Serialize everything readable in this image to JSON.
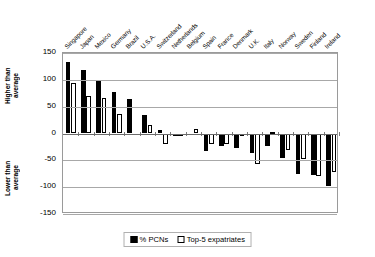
{
  "chart_data": {
    "type": "bar",
    "title": "",
    "subtitle": "",
    "xlabel": "",
    "ylabel": "",
    "ylim": [
      -150,
      150
    ],
    "yticks": [
      150,
      100,
      50,
      0,
      -50,
      -100,
      -150
    ],
    "grid": true,
    "legend_position": "bottom",
    "axis_annotations": {
      "upper": "Higher than\naverage",
      "lower": "Lower than\naverage"
    },
    "categories": [
      "Singapore",
      "Japan",
      "Mexico",
      "Germany",
      "Brazil",
      "U.S.A.",
      "Switzerland",
      "Netherlands",
      "Belgium",
      "Spain",
      "France",
      "Denmark",
      "U.K.",
      "Italy",
      "Norway",
      "Sweden",
      "Finland",
      "Ireland"
    ],
    "series": [
      {
        "name": "% PCNs",
        "color": "#000000",
        "style": "filled",
        "values": [
          134,
          118,
          100,
          78,
          65,
          34,
          6,
          -3,
          0,
          -33,
          -23,
          -27,
          -37,
          -23,
          -45,
          -76,
          -77,
          -98
        ]
      },
      {
        "name": "Top-5 expatriates",
        "color": "#ffffff",
        "style": "outline",
        "values": [
          94,
          69,
          66,
          36,
          0,
          16,
          -19,
          -1,
          8,
          -20,
          -19,
          -2,
          -56,
          2,
          -30,
          -47,
          -80,
          -72
        ]
      }
    ]
  },
  "legend": {
    "items": [
      {
        "label": "% PCNs"
      },
      {
        "label": "Top-5 expatriates"
      }
    ]
  },
  "colors": {
    "series_pcn": "#000000",
    "series_expat": "#ffffff",
    "gridline": "#a8a8a8",
    "axis": "#6b6b6b",
    "background": "#ffffff"
  }
}
